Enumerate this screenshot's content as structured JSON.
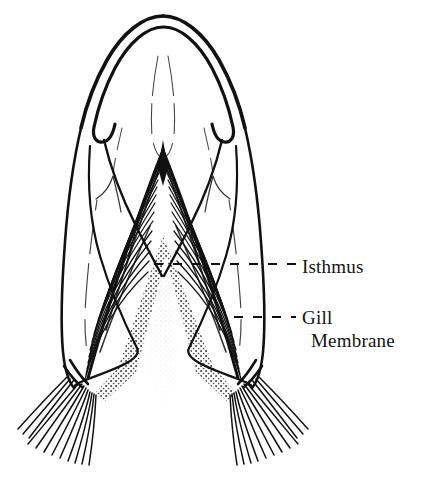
{
  "figure": {
    "name": "fish-ventral-head-diagram",
    "background_color": "#ffffff",
    "ink_color": "#111111",
    "view": "ventral"
  },
  "labels": [
    {
      "id": "isthmus",
      "text": "Isthmus",
      "line1": "Isthmus",
      "line2": "",
      "leader": {
        "style": "dashed",
        "x1": 154,
        "y1": 264,
        "x2": 296,
        "y2": 264
      }
    },
    {
      "id": "gill-membrane",
      "text": "Gill Membrane",
      "line1": "Gill",
      "line2": "Membrane",
      "leader": {
        "style": "dashed",
        "x1": 234,
        "y1": 317,
        "x2": 296,
        "y2": 317
      }
    }
  ],
  "structures": {
    "snout_tip": "rounded-double-line-lip",
    "jaw_hooks": "paired-maxillary-hooks",
    "central_apex": "isthmus-apex",
    "stipple_column": "isthmus-shading",
    "hatching": "gill-membrane-striations",
    "ray_fans": "branchiostegal-rays"
  }
}
